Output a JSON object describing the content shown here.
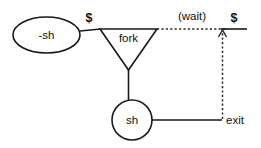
{
  "diagram": {
    "colors": {
      "stroke": "#1a1a1a",
      "dashed_stroke": "#2b2b2b",
      "text": "#111111",
      "background": "#ffffff"
    },
    "nodes": [
      {
        "id": "login-shell",
        "shape": "ellipse",
        "label": "-sh",
        "cx": 46.5,
        "cy": 35,
        "rx": 33.5,
        "ry": 18
      },
      {
        "id": "fork",
        "shape": "triangle-down",
        "label": "fork",
        "label_x": 128.5,
        "label_y": 39,
        "points": "100,29 157,29 128.5,70"
      },
      {
        "id": "child-shell",
        "shape": "circle",
        "label": "sh",
        "cx": 132,
        "cy": 120,
        "r": 20
      }
    ],
    "edges": [
      {
        "id": "login-to-fork",
        "style": "solid",
        "from": "login-shell",
        "to": "fork",
        "path": "M 80 31 L 101 29"
      },
      {
        "id": "fork-to-child",
        "style": "solid",
        "from": "fork",
        "to": "child-shell",
        "path": "M 128.5 69 L 128.5 100"
      },
      {
        "id": "child-to-exit",
        "style": "solid",
        "from": "child-shell",
        "to": "exit-point",
        "path": "M 152 120 L 222 120"
      },
      {
        "id": "wait-edge",
        "style": "dashed",
        "from": "fork",
        "to": "prompt-return",
        "path": "M 157 29 L 228 29"
      },
      {
        "id": "exit-return-edge",
        "style": "dashed",
        "from": "exit-point",
        "to": "prompt-return",
        "path": "M 222.5 119 L 222.5 33"
      },
      {
        "id": "prompt-baseline",
        "style": "solid",
        "from": "prompt-return",
        "to": "prompt-end",
        "path": "M 221 29 L 247 29"
      }
    ],
    "arrowheads": [
      {
        "id": "return-arrowhead",
        "direction": "up",
        "points": "218.5,37 222.5,30 226.5,37"
      }
    ],
    "labels": [
      {
        "id": "prompt-left",
        "text": "$",
        "x": 89,
        "y": 22,
        "class": "sigil"
      },
      {
        "id": "wait",
        "text": "(wait)",
        "x": 192,
        "y": 20,
        "class": "edge"
      },
      {
        "id": "prompt-right",
        "text": "$",
        "x": 234,
        "y": 22,
        "class": "sigil"
      },
      {
        "id": "exit",
        "text": "exit",
        "x": 226,
        "y": 124,
        "class": "edge-left"
      }
    ]
  }
}
